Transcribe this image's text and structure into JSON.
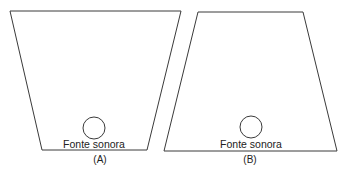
{
  "diagram": {
    "panels": [
      {
        "id": "A",
        "caption": "(A)",
        "shape": "trapezoid-wide-top",
        "points": [
          [
            10,
            11
          ],
          [
            181,
            11
          ],
          [
            147,
            150
          ],
          [
            42,
            150
          ]
        ],
        "source": {
          "label": "Fonte sonora",
          "cx": 94,
          "cy": 128,
          "r": 11
        },
        "label_pos": [
          94,
          148
        ],
        "caption_pos": [
          100,
          162
        ]
      },
      {
        "id": "B",
        "caption": "(B)",
        "shape": "trapezoid-wide-bottom",
        "points": [
          [
            198,
            12
          ],
          [
            303,
            12
          ],
          [
            337,
            151
          ],
          [
            164,
            151
          ]
        ],
        "source": {
          "label": "Fonte sonora",
          "cx": 251,
          "cy": 127,
          "r": 11
        },
        "label_pos": [
          251,
          148
        ],
        "caption_pos": [
          250,
          162
        ]
      }
    ],
    "colors": {
      "stroke": "#3a3a3a",
      "text": "#222222",
      "background": "#ffffff"
    }
  }
}
